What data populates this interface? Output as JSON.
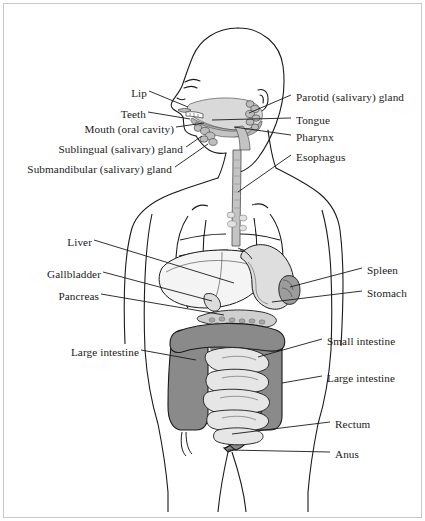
{
  "figure": {
    "view": "anterior body outline with left lateral head profile",
    "border_color": "#c9c9c9",
    "background_color": "#ffffff",
    "line_color": "#1a1a1a",
    "shade_colors": {
      "organ_dark_gray": "#8a8a8a",
      "organ_mid_gray": "#b5b5b5",
      "organ_light_gray": "#d9d9d9",
      "organ_pale_gray": "#efefef"
    }
  },
  "labels": {
    "left": [
      {
        "id": "lip",
        "text": "Lip",
        "x": 129,
        "y": 94,
        "anchor_x": 188,
        "anchor_y": 105
      },
      {
        "id": "teeth",
        "text": "Teeth",
        "x": 113,
        "y": 115,
        "anchor_x": 190,
        "anchor_y": 121
      },
      {
        "id": "mouth-oral-cavity",
        "text": "Mouth (oral cavity)",
        "x": 62,
        "y": 130,
        "anchor_x": 204,
        "anchor_y": 123
      },
      {
        "id": "sublingual-salivary-gland",
        "text": "Sublingual (salivary) gland",
        "x": 16,
        "y": 150,
        "anchor_x": 200,
        "anchor_y": 137
      },
      {
        "id": "submandibular-salivary-gland",
        "text": "Submandibular (salivary) gland",
        "x": 12,
        "y": 170,
        "anchor_x": 206,
        "anchor_y": 145
      },
      {
        "id": "liver",
        "text": "Liver",
        "x": 67,
        "y": 243,
        "anchor_x": 229,
        "anchor_y": 282
      },
      {
        "id": "gallbladder",
        "text": "Gallbladder",
        "x": 38,
        "y": 275,
        "anchor_x": 209,
        "anchor_y": 300
      },
      {
        "id": "pancreas",
        "text": "Pancreas",
        "x": 50,
        "y": 297,
        "anchor_x": 222,
        "anchor_y": 314
      },
      {
        "id": "large-intestine-left",
        "text": "Large intestine",
        "x": 70,
        "y": 353,
        "anchor_x": 196,
        "anchor_y": 359
      }
    ],
    "right": [
      {
        "id": "parotid-salivary-gland",
        "text": "Parotid (salivary) gland",
        "x": 296,
        "y": 98,
        "anchor_x": 247,
        "anchor_y": 114
      },
      {
        "id": "tongue",
        "text": "Tongue",
        "x": 296,
        "y": 121,
        "anchor_x": 213,
        "anchor_y": 121
      },
      {
        "id": "pharynx",
        "text": "Pharynx",
        "x": 296,
        "y": 138,
        "anchor_x": 233,
        "anchor_y": 128
      },
      {
        "id": "esophagus",
        "text": "Esophagus",
        "x": 296,
        "y": 158,
        "anchor_x": 236,
        "anchor_y": 190
      },
      {
        "id": "spleen",
        "text": "Spleen",
        "x": 367,
        "y": 271,
        "anchor_x": 288,
        "anchor_y": 287
      },
      {
        "id": "stomach",
        "text": "Stomach",
        "x": 367,
        "y": 294,
        "anchor_x": 272,
        "anchor_y": 301
      },
      {
        "id": "small-intestine",
        "text": "Small intestine",
        "x": 327,
        "y": 342,
        "anchor_x": 258,
        "anchor_y": 356
      },
      {
        "id": "large-intestine-right",
        "text": "Large intestine",
        "x": 327,
        "y": 379,
        "anchor_x": 281,
        "anchor_y": 382
      },
      {
        "id": "rectum",
        "text": "Rectum",
        "x": 335,
        "y": 425,
        "anchor_x": 232,
        "anchor_y": 433
      },
      {
        "id": "anus",
        "text": "Anus",
        "x": 335,
        "y": 455,
        "anchor_x": 228,
        "anchor_y": 450
      }
    ]
  }
}
